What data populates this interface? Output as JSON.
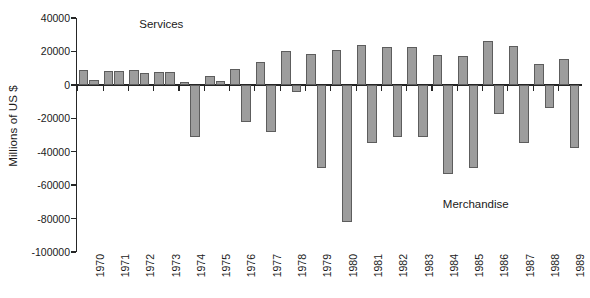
{
  "chart_data": {
    "type": "bar",
    "title": "",
    "subtitle": "",
    "xlabel": "",
    "ylabel": "Millions of US $",
    "ylim": [
      -100000,
      40000
    ],
    "ytick_values": [
      40000,
      20000,
      0,
      -20000,
      -40000,
      -60000,
      -80000,
      -100000
    ],
    "ytick_labels": [
      "40000",
      "20000",
      "0",
      "-20000",
      "-40000",
      "-60000",
      "-80000",
      "-100000"
    ],
    "grid": false,
    "legend_position": "inline-annotation",
    "bar_color": "#9d9d9d",
    "bar_edge_color": "#5d5d5d",
    "axis_color": "#262626",
    "categories": [
      "1970",
      "1971",
      "1972",
      "1973",
      "1974",
      "1975",
      "1976",
      "1977",
      "1978",
      "1979",
      "1980",
      "1981",
      "1982",
      "1983",
      "1984",
      "1985",
      "1986",
      "1987",
      "1988",
      "1989"
    ],
    "series": [
      {
        "name": "Services",
        "annotation": "Services",
        "values": [
          9000,
          8500,
          9000,
          7500,
          1500,
          5500,
          9500,
          13500,
          20500,
          18500,
          21000,
          24000,
          22500,
          22500,
          18000,
          17000,
          26500,
          23000,
          12500,
          15500
        ]
      },
      {
        "name": "Merchandise",
        "annotation": "Merchandise",
        "values": [
          3000,
          8500,
          7000,
          7500,
          -31000,
          2500,
          -22500,
          -28000,
          -4500,
          -50000,
          -82000,
          -35000,
          -31000,
          -31500,
          -53500,
          -50000,
          -17500,
          -35000,
          -14000,
          -38000
        ]
      }
    ],
    "annotations": [
      {
        "text": "Services",
        "x_category": "1972",
        "y_value": 36000
      },
      {
        "text": "Merchandise",
        "x_category": "1984",
        "y_value": -72000
      }
    ]
  }
}
